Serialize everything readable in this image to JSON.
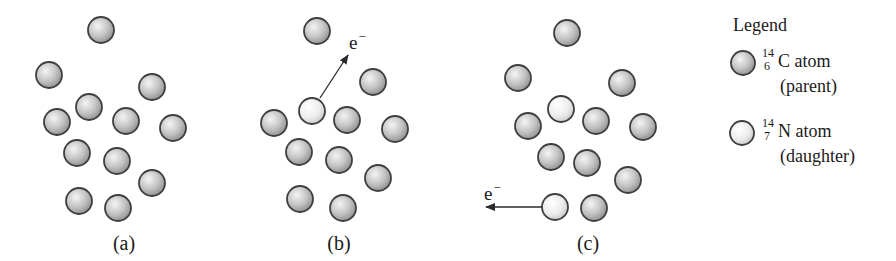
{
  "figure": {
    "colors": {
      "parent_fill_light": "#f2f2f2",
      "parent_fill_dark": "#9a9a9a",
      "daughter_fill_light": "#ffffff",
      "daughter_fill_dark": "#cfcfcf",
      "atom_stroke": "#3f3f3f",
      "arrow": "#2a2a2a",
      "text": "#1a1a1a"
    },
    "atom_radius": 13,
    "panels": [
      {
        "label": "(a)",
        "label_x": 124,
        "atoms": [
          {
            "x": 101,
            "y": 30,
            "type": "parent"
          },
          {
            "x": 49,
            "y": 75,
            "type": "parent"
          },
          {
            "x": 152,
            "y": 87,
            "type": "parent"
          },
          {
            "x": 89,
            "y": 107,
            "type": "parent"
          },
          {
            "x": 57,
            "y": 122,
            "type": "parent"
          },
          {
            "x": 126,
            "y": 121,
            "type": "parent"
          },
          {
            "x": 173,
            "y": 128,
            "type": "parent"
          },
          {
            "x": 77,
            "y": 153,
            "type": "parent"
          },
          {
            "x": 117,
            "y": 161,
            "type": "parent"
          },
          {
            "x": 152,
            "y": 183,
            "type": "parent"
          },
          {
            "x": 79,
            "y": 201,
            "type": "parent"
          },
          {
            "x": 118,
            "y": 208,
            "type": "parent"
          }
        ],
        "emissions": []
      },
      {
        "label": "(b)",
        "label_x": 339,
        "atoms": [
          {
            "x": 317,
            "y": 31,
            "type": "parent"
          },
          {
            "x": 373,
            "y": 82,
            "type": "parent"
          },
          {
            "x": 312,
            "y": 111,
            "type": "daughter"
          },
          {
            "x": 274,
            "y": 123,
            "type": "parent"
          },
          {
            "x": 347,
            "y": 120,
            "type": "parent"
          },
          {
            "x": 395,
            "y": 129,
            "type": "parent"
          },
          {
            "x": 299,
            "y": 152,
            "type": "parent"
          },
          {
            "x": 339,
            "y": 160,
            "type": "parent"
          },
          {
            "x": 378,
            "y": 178,
            "type": "parent"
          },
          {
            "x": 300,
            "y": 199,
            "type": "parent"
          },
          {
            "x": 343,
            "y": 208,
            "type": "parent"
          }
        ],
        "emissions": [
          {
            "label": "e",
            "charge": "−",
            "from_x": 320,
            "from_y": 98,
            "to_x": 348,
            "to_y": 55,
            "label_x": 349,
            "label_y": 33
          }
        ]
      },
      {
        "label": "(c)",
        "label_x": 588,
        "atoms": [
          {
            "x": 567,
            "y": 33,
            "type": "parent"
          },
          {
            "x": 518,
            "y": 78,
            "type": "parent"
          },
          {
            "x": 622,
            "y": 83,
            "type": "parent"
          },
          {
            "x": 561,
            "y": 109,
            "type": "daughter"
          },
          {
            "x": 528,
            "y": 126,
            "type": "parent"
          },
          {
            "x": 596,
            "y": 121,
            "type": "parent"
          },
          {
            "x": 643,
            "y": 127,
            "type": "parent"
          },
          {
            "x": 551,
            "y": 157,
            "type": "parent"
          },
          {
            "x": 587,
            "y": 163,
            "type": "parent"
          },
          {
            "x": 628,
            "y": 180,
            "type": "parent"
          },
          {
            "x": 555,
            "y": 207,
            "type": "daughter"
          },
          {
            "x": 594,
            "y": 208,
            "type": "parent"
          }
        ],
        "emissions": [
          {
            "label": "e",
            "charge": "−",
            "from_x": 542,
            "from_y": 207,
            "to_x": 486,
            "to_y": 207,
            "label_x": 484,
            "label_y": 184
          }
        ]
      }
    ],
    "panel_label_y": 233
  },
  "legend": {
    "title": "Legend",
    "items": [
      {
        "type": "parent",
        "mass_number": "14",
        "atomic_number": "6",
        "symbol": "C",
        "name_suffix": " atom",
        "role": "(parent)"
      },
      {
        "type": "daughter",
        "mass_number": "14",
        "atomic_number": "7",
        "symbol": "N",
        "name_suffix": " atom",
        "role": "(daughter)"
      }
    ]
  }
}
